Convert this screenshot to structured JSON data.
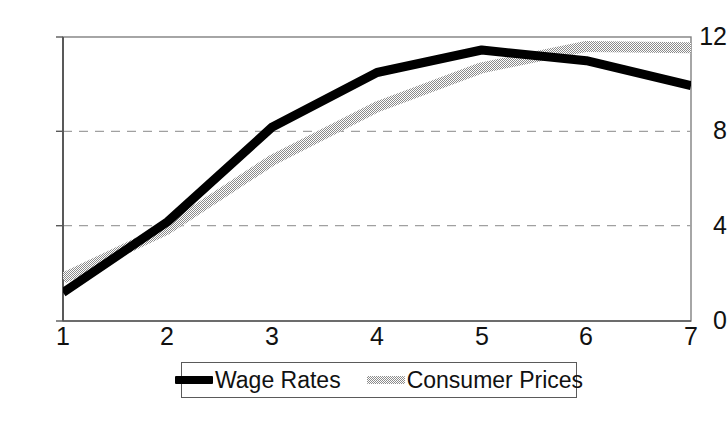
{
  "chart_data": {
    "type": "line",
    "title": "",
    "xlabel": "",
    "ylabel": "",
    "x": [
      1,
      2,
      3,
      4,
      5,
      6,
      7
    ],
    "xlim": [
      1,
      7
    ],
    "ylim": [
      0,
      12
    ],
    "xticks": [
      "1",
      "2",
      "3",
      "4",
      "5",
      "6",
      "7"
    ],
    "yticks": [
      "0",
      "4",
      "8",
      "12"
    ],
    "grid": "horizontal-dashed",
    "legend_position": "bottom-center",
    "series": [
      {
        "name": "Wage Rates",
        "color": "#000000",
        "style": "solid-thick",
        "values": [
          1.2,
          4.2,
          8.2,
          10.5,
          11.45,
          11.0,
          9.95
        ]
      },
      {
        "name": "Consumer Prices",
        "color": "#a8a8a8",
        "style": "dithered-thick",
        "values": [
          1.8,
          3.9,
          6.8,
          9.05,
          10.7,
          11.6,
          11.55
        ]
      }
    ]
  },
  "axes": {
    "y_tick_labels": [
      "12",
      "8",
      "4",
      "0"
    ],
    "x_tick_labels": [
      "1",
      "2",
      "3",
      "4",
      "5",
      "6",
      "7"
    ]
  },
  "legend": {
    "items": [
      {
        "label": "Wage Rates",
        "swatch": "line-swatch-black"
      },
      {
        "label": "Consumer Prices",
        "swatch": "line-swatch-gray"
      }
    ]
  }
}
